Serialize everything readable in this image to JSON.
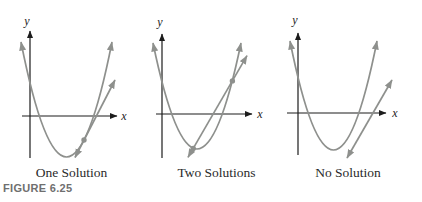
{
  "figure_label": "FIGURE 6.25",
  "colors": {
    "background": "#ffffff",
    "axis": "#1c1c1c",
    "curve": "#8e908d",
    "caption": "#2a2a2a",
    "figure_label": "#6f6f6f"
  },
  "panels": [
    {
      "caption": "One Solution",
      "x_axis_label": "x",
      "y_axis_label": "y"
    },
    {
      "caption": "Two Solutions",
      "x_axis_label": "x",
      "y_axis_label": "y"
    },
    {
      "caption": "No Solution",
      "x_axis_label": "x",
      "y_axis_label": "y"
    }
  ]
}
